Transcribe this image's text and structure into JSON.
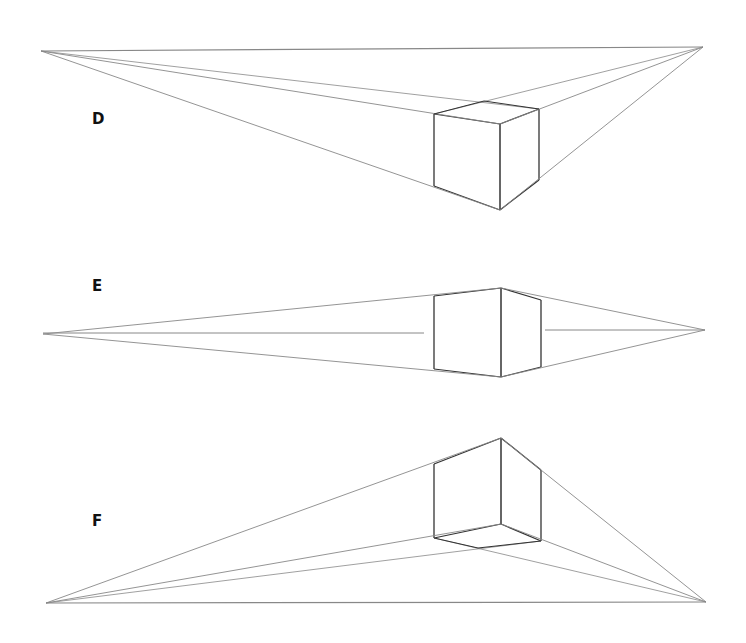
{
  "panels": [
    {
      "label": "D",
      "label_pos": [
        92,
        110
      ],
      "vp_left": [
        41,
        51
      ],
      "vp_right": [
        703,
        47
      ],
      "box": {
        "front_top": [
          500,
          124
        ],
        "front_bottom": [
          500,
          210
        ],
        "left_top": [
          434,
          114
        ],
        "left_bottom": [
          434,
          186
        ],
        "right_top": [
          539,
          109
        ],
        "right_bottom": [
          539,
          180
        ],
        "back_top": [
          484,
          101
        ]
      },
      "eye_level": "above box"
    },
    {
      "label": "E",
      "label_pos": [
        92,
        277
      ],
      "vp_left": [
        43,
        334
      ],
      "vp_right": [
        705,
        330
      ],
      "box": {
        "front_top": [
          501,
          288
        ],
        "front_bottom": [
          501,
          377
        ],
        "left_top": [
          434,
          296
        ],
        "left_bottom": [
          434,
          369
        ],
        "right_top": [
          541,
          300
        ],
        "right_bottom": [
          541,
          367
        ]
      },
      "horizon_segments": [
        [
          [
            43,
            333
          ],
          [
            424,
            333
          ]
        ],
        [
          [
            545,
            330
          ],
          [
            705,
            330
          ]
        ]
      ],
      "eye_level": "through box"
    },
    {
      "label": "F",
      "label_pos": [
        92,
        512
      ],
      "vp_left": [
        46,
        603
      ],
      "vp_right": [
        706,
        602
      ],
      "box": {
        "front_top": [
          501,
          438
        ],
        "front_bottom": [
          501,
          524
        ],
        "left_top": [
          434,
          464
        ],
        "left_bottom": [
          434,
          538
        ],
        "right_top": [
          541,
          470
        ],
        "right_bottom": [
          541,
          541
        ],
        "back_bottom": [
          478,
          548
        ]
      },
      "eye_level": "below box"
    }
  ],
  "colors": {
    "line": "#333333",
    "light_line": "#888888",
    "background": "#ffffff"
  }
}
